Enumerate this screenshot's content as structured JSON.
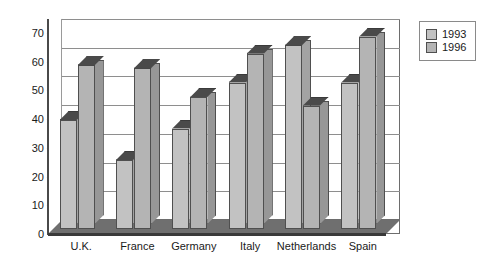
{
  "chart_data": {
    "type": "bar",
    "title": "",
    "subtitle": "",
    "xlabel": "",
    "ylabel": "",
    "categories": [
      "U.K.",
      "France",
      "Germany",
      "Italy",
      "Netherlands",
      "Spain"
    ],
    "series": [
      {
        "name": "1993",
        "color": "#c2c2c2",
        "values": [
          38,
          24,
          35,
          51,
          64,
          51
        ]
      },
      {
        "name": "1996",
        "color": "#b4b4b4",
        "values": [
          57,
          56,
          46,
          61,
          43,
          67
        ]
      }
    ],
    "ylim": [
      0,
      70
    ],
    "yticks": [
      0,
      10,
      20,
      30,
      40,
      50,
      60,
      70
    ],
    "ytick_labels": [
      "0",
      "10",
      "20",
      "30",
      "40",
      "50",
      "60",
      "70"
    ],
    "grid": true,
    "grid_axis": "y",
    "legend_position": "right",
    "style": "3d-column"
  },
  "legend": {
    "entries": [
      {
        "label": "1993"
      },
      {
        "label": "1996"
      }
    ]
  }
}
